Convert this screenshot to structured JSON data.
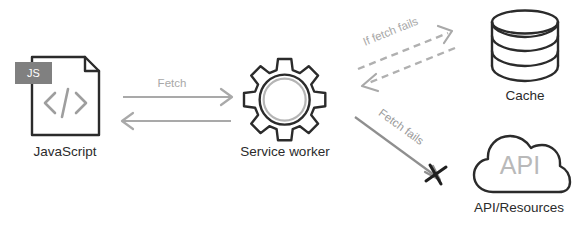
{
  "diagram": {
    "colors": {
      "node_outline": "#2b2b2b",
      "label_text": "#2b2b2b",
      "edge_gray": "#a9a9a9",
      "edge_dashed_gray": "#b0b0b0",
      "js_badge_bg": "#808080",
      "js_badge_text": "#ffffff",
      "api_text_gray": "#b9b9b9",
      "gear_inner_ring": "#b5b5b5",
      "cross_mark": "#1f1f1f",
      "background": "#ffffff"
    },
    "nodes": [
      {
        "id": "javascript",
        "label": "JavaScript",
        "icon": "js-file-icon",
        "badge_text": "JS",
        "glyph_text": "</>"
      },
      {
        "id": "service-worker",
        "label": "Service worker",
        "icon": "gear-icon"
      },
      {
        "id": "cache",
        "label": "Cache",
        "icon": "database-cylinder-icon"
      },
      {
        "id": "api-resources",
        "label": "API/Resources",
        "icon": "cloud-icon",
        "inner_text": "API"
      }
    ],
    "edges": [
      {
        "id": "js-to-sw",
        "label": "Fetch",
        "from": "javascript",
        "to": "service-worker",
        "style": "solid",
        "direction": "bidirectional"
      },
      {
        "id": "sw-to-cache",
        "label": "If fetch fails",
        "from": "service-worker",
        "to": "cache",
        "style": "dashed",
        "direction": "bidirectional"
      },
      {
        "id": "sw-to-api",
        "label": "Fetch fails",
        "from": "service-worker",
        "to": "api-resources",
        "style": "solid",
        "direction": "forward",
        "terminator": "cross-mark"
      }
    ]
  }
}
